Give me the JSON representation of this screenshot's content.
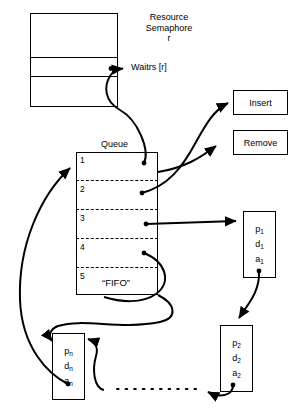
{
  "diagram": {
    "semaphore": {
      "label_line1": "Resource",
      "label_line2": "Semaphore",
      "label_line3": "r",
      "waiters_label": "Waitrs [r]",
      "rows": [
        "",
        "",
        ""
      ]
    },
    "queue": {
      "title": "Queue",
      "slots": [
        "1",
        "2",
        "3",
        "4",
        "5"
      ],
      "discipline_label": "“FIFO”"
    },
    "operations": [
      {
        "label": "Insert"
      },
      {
        "label": "Remove"
      }
    ],
    "pcbs": [
      {
        "name": "pcb-p1",
        "p": "p",
        "p_sub": "1",
        "d": "d",
        "d_sub": "1",
        "a": "a",
        "a_sub": "1"
      },
      {
        "name": "pcb-p2",
        "p": "p",
        "p_sub": "2",
        "d": "d",
        "d_sub": "2",
        "a": "a",
        "a_sub": "2"
      },
      {
        "name": "pcb-pn",
        "p": "p",
        "p_sub": "n",
        "d": "d",
        "d_sub": "n",
        "a": "a",
        "a_sub": "n"
      }
    ],
    "ellipsis": "· · · · · · · · · ·",
    "colors": {
      "stroke": "#000000",
      "background": "#ffffff"
    }
  }
}
